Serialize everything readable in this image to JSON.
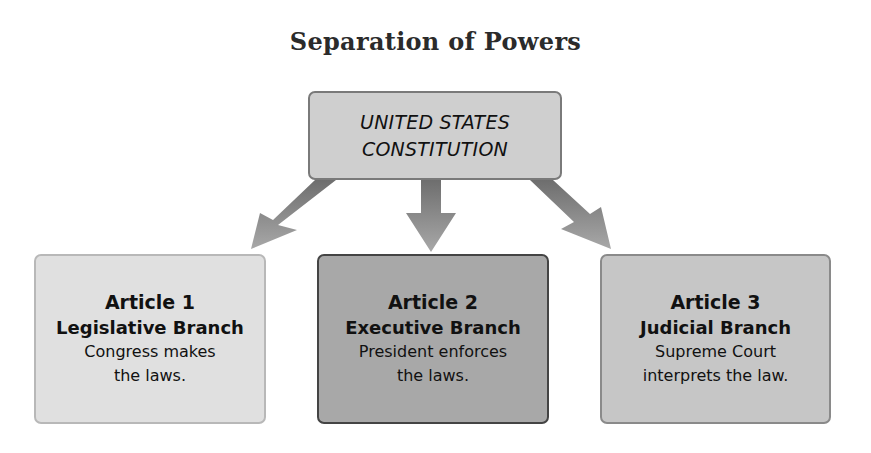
{
  "title": "Separation of Powers",
  "root": {
    "lines": [
      "UNITED STATES",
      "CONSTITUTION"
    ]
  },
  "branches": [
    {
      "article": "Article 1",
      "branch": "Legislative Branch",
      "desc_line1": "Congress makes",
      "desc_line2": "the laws."
    },
    {
      "article": "Article 2",
      "branch": "Executive Branch",
      "desc_line1": "President enforces",
      "desc_line2": "the laws."
    },
    {
      "article": "Article 3",
      "branch": "Judicial Branch",
      "desc_line1": "Supreme Court",
      "desc_line2": "interprets the law."
    }
  ],
  "colors": {
    "root_fill": "#cfcfcf",
    "legislative_fill": "#e0e0e0",
    "executive_fill": "#a8a8a8",
    "judicial_fill": "#c6c6c6",
    "arrow": "#8c8c8c"
  }
}
